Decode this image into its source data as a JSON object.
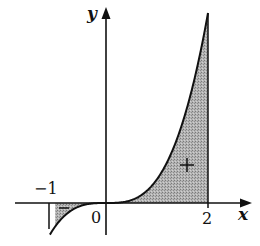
{
  "figure": {
    "type": "area-under-curve diagram",
    "function": "y = x^3",
    "axes": {
      "x_label": "x",
      "y_label": "y"
    },
    "tick_labels": {
      "neg_one": "−1",
      "zero": "0",
      "two": "2"
    },
    "regions": [
      {
        "name": "negative-region",
        "interval": [
          -1,
          0
        ],
        "sign_marker": "−"
      },
      {
        "name": "positive-region",
        "interval": [
          0,
          2
        ],
        "sign_marker": "+"
      }
    ],
    "colors": {
      "ink": "#111111",
      "shade": "#a8a8a8",
      "background": "#ffffff"
    }
  }
}
